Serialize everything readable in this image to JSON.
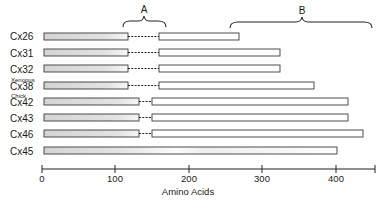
{
  "figure": {
    "braces": [
      {
        "label": "A",
        "from_aa": 110,
        "to_aa": 175
      },
      {
        "label": "B",
        "from_aa": 257,
        "to_aa": 434
      }
    ],
    "rows": [
      {
        "name": "Cx26",
        "prefix": "",
        "seg1_end": 118,
        "gap_end": 159,
        "seg2_end": 266
      },
      {
        "name": "Cx31",
        "prefix": "",
        "seg1_end": 118,
        "gap_end": 159,
        "seg2_end": 322
      },
      {
        "name": "Cx32",
        "prefix": "",
        "seg1_end": 118,
        "gap_end": 159,
        "seg2_end": 322
      },
      {
        "name": "Cx38",
        "prefix": "Xenopus",
        "seg1_end": 118,
        "gap_end": 159,
        "seg2_end": 368
      },
      {
        "name": "Cx42",
        "prefix": "Chick",
        "seg1_end": 132,
        "gap_end": 147,
        "seg2_end": 414
      },
      {
        "name": "Cx43",
        "prefix": "",
        "seg1_end": 132,
        "gap_end": 147,
        "seg2_end": 414
      },
      {
        "name": "Cx46",
        "prefix": "",
        "seg1_end": 132,
        "gap_end": 147,
        "seg2_end": 434
      },
      {
        "name": "Cx45",
        "prefix": "",
        "seg1_end": null,
        "gap_end": null,
        "seg2_end": 400
      }
    ],
    "axis": {
      "label": "Amino Acids",
      "ticks": [
        "0",
        "100",
        "200",
        "300",
        "400"
      ],
      "max": 450
    },
    "colors": {
      "outline": "#3a3a3a",
      "shade_left": "#d6d6d6",
      "shade_right": "#f4f4f4",
      "fill_plain": "#ffffff"
    }
  },
  "labels": {
    "brace_a": "A",
    "brace_b": "B",
    "row_0": "Cx26",
    "row_1": "Cx31",
    "row_2": "Cx32",
    "row_3_prefix": "Xenopus",
    "row_3": "Cx38",
    "row_4_prefix": "Chick",
    "row_4": "Cx42",
    "row_5": "Cx43",
    "row_6": "Cx46",
    "row_7": "Cx45",
    "tick_0": "0",
    "tick_1": "100",
    "tick_2": "200",
    "tick_3": "300",
    "tick_4": "400",
    "axis_label": "Amino Acids"
  }
}
